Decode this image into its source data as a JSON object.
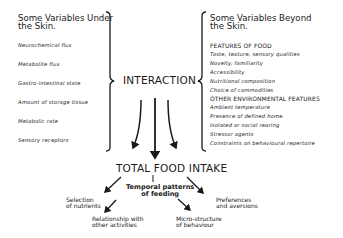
{
  "left_panel": {
    "title_line1": "Some Variables Under",
    "title_line2": "the Skin.",
    "items": [
      "Neurochemical flux",
      "Metabolite flux",
      "Gastro-intestinal state",
      "Amount of storage tissue",
      "Metabolic rate",
      "Sensory receptors"
    ]
  },
  "right_panel": {
    "title_line1": "Some Variables Beyond",
    "title_line2": "the Skin.",
    "section1_heading": "FEATURES OF FOOD",
    "section1_items": [
      "Taste, texture, sensory qualities",
      "Novelty, familiarity",
      "Accessibility",
      "Nutritional composition",
      "Choice of commodities"
    ],
    "section2_heading": "OTHER ENVIRONMENTAL FEATURES",
    "section2_items": [
      "Ambient temperature",
      "Presence of defined home",
      "Isolated or social rearing",
      "Stressor agents",
      "Constraints on behavioural repertoire"
    ]
  },
  "center": {
    "interaction": "INTERACTION",
    "total": "TOTAL FOOD INTAKE",
    "temporal_line1": "Temporal patterns",
    "temporal_line2": "of feeding"
  },
  "outcomes": {
    "selection_line1": "Selection",
    "selection_line2": "of nutrients",
    "relationship_line1": "Relationship with",
    "relationship_line2": "other activities",
    "micro_line1": "Micro-structure",
    "micro_line2": "of behaviour",
    "preferences_line1": "Preferences",
    "preferences_line2": "and aversions"
  }
}
